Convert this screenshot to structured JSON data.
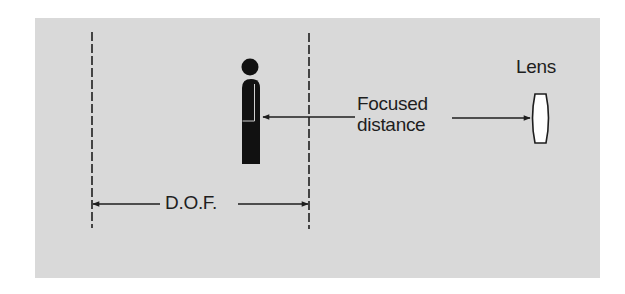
{
  "diagram": {
    "labels": {
      "lens": "Lens",
      "focused_line1": "Focused",
      "focused_line2": "distance",
      "dof": "D.O.F."
    },
    "elements": {
      "subject": "person-silhouette",
      "lens": "convex-lens",
      "dof_limits": [
        "near-limit-dashed-line",
        "far-limit-dashed-line"
      ],
      "arrows": [
        "focused-distance-arrow-to-subject",
        "focused-distance-arrow-to-lens",
        "dof-span-arrow"
      ]
    },
    "colors": {
      "background": "#d9d9d9",
      "ink": "#1e1e1e",
      "lens_fill": "#ffffff"
    }
  }
}
